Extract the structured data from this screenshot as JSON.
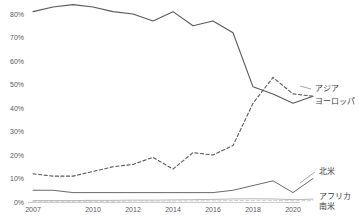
{
  "chart_data": {
    "type": "line",
    "title": "",
    "subtitle": "",
    "xlabel": "",
    "ylabel": "",
    "x": [
      2007,
      2008,
      2009,
      2010,
      2011,
      2012,
      2013,
      2014,
      2015,
      2016,
      2017,
      2018,
      2019,
      2020,
      2021
    ],
    "xtick_labels": [
      "2007",
      "2010",
      "2012",
      "2014",
      "2016",
      "2018",
      "2020"
    ],
    "xtick_values": [
      2007,
      2010,
      2012,
      2014,
      2016,
      2018,
      2020
    ],
    "ytick_labels": [
      "0%",
      "10%",
      "20%",
      "30%",
      "40%",
      "50%",
      "60%",
      "70%",
      "80%"
    ],
    "ytick_values": [
      0,
      10,
      20,
      30,
      40,
      50,
      60,
      70,
      80
    ],
    "ylim": [
      0,
      84
    ],
    "xlim": [
      2007,
      2021
    ],
    "grid": false,
    "legend_position": "right-inline-labels",
    "series": [
      {
        "name": "アジア",
        "style": "solid",
        "color": "#595959",
        "width": 1.1,
        "label_x": 2021.3,
        "label_y": 49,
        "values": [
          81,
          83,
          84,
          83,
          81,
          80,
          77,
          81,
          75,
          77,
          72,
          49,
          46,
          42,
          45
        ]
      },
      {
        "name": "ヨーロッパ",
        "style": "dashed",
        "color": "#595959",
        "width": 1.1,
        "label_x": 2021.3,
        "label_y": 40,
        "values": [
          12,
          11,
          11,
          13,
          15,
          16,
          19,
          14,
          21,
          20,
          24,
          42,
          53,
          46,
          45
        ]
      },
      {
        "name": "北米",
        "style": "solid",
        "color": "#595959",
        "width": 0.9,
        "label_x": 2021.3,
        "label_y": 12,
        "values": [
          5,
          5,
          4,
          4,
          4,
          4,
          4,
          4,
          4,
          4,
          5,
          7,
          9,
          4,
          10
        ]
      },
      {
        "name": "アフリカ",
        "style": "solid",
        "color": "#a6a6a6",
        "width": 0.8,
        "label_x": 2021.3,
        "label_y": 4,
        "values": [
          0.6,
          0.6,
          0.6,
          0.7,
          0.7,
          0.8,
          0.8,
          0.9,
          1.0,
          1.1,
          1.3,
          1.4,
          1.3,
          1.0,
          1.2
        ]
      },
      {
        "name": "南米",
        "style": "dashed",
        "color": "#bfbfbf",
        "width": 0.8,
        "label_x": 2021.3,
        "label_y": -1,
        "values": [
          0.3,
          0.3,
          0.3,
          0.3,
          0.3,
          0.4,
          0.4,
          0.4,
          0.5,
          0.5,
          0.6,
          0.7,
          0.7,
          0.5,
          0.6
        ]
      }
    ]
  }
}
